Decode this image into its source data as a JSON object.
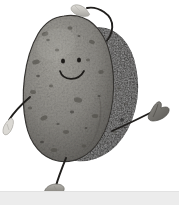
{
  "scene": {
    "title": "Dancing Potato Character",
    "description": "Cartoon anthropomorphic potato with arms, legs and a smiling face",
    "background_color": "#ffffff",
    "ground_color": "#ececec",
    "width": 179,
    "height": 205
  },
  "character": {
    "name": "potato-character",
    "body": {
      "front_lobe_color": "#8f8d88",
      "front_lobe_shadow": "#6d6b66",
      "back_lobe_color": "#2e2c2a",
      "outline_color": "#3a3835",
      "texture_spot_color": "#4a4844",
      "highlight_color": "#b3b1ab"
    },
    "face": {
      "eye_color": "#1d1b19",
      "mouth_color": "#1d1b19",
      "expression": "smiling"
    },
    "limbs": {
      "limb_color": "#201e1c",
      "raised_hand_color": "#c9c7c2",
      "right_hand_color": "#6f6d68",
      "left_hand_color": "#d8d6d1",
      "foot_color": "#8d8b86"
    }
  },
  "parts": [
    {
      "id": "back-lobe",
      "label": "Back potato lobe"
    },
    {
      "id": "front-lobe",
      "label": "Front potato lobe"
    },
    {
      "id": "raised-arm",
      "label": "Raised left arm over head"
    },
    {
      "id": "raised-hand",
      "label": "Raised hand"
    },
    {
      "id": "lower-left-arm",
      "label": "Lower left arm"
    },
    {
      "id": "left-hand",
      "label": "Left hand"
    },
    {
      "id": "right-arm",
      "label": "Right arm"
    },
    {
      "id": "right-hand",
      "label": "Right hand"
    },
    {
      "id": "leg",
      "label": "Leg"
    },
    {
      "id": "foot",
      "label": "Foot"
    },
    {
      "id": "left-eye",
      "label": "Left eye"
    },
    {
      "id": "right-eye",
      "label": "Right eye"
    },
    {
      "id": "mouth",
      "label": "Smiling mouth"
    }
  ]
}
